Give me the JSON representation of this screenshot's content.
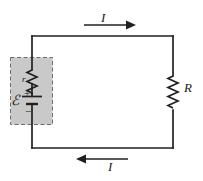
{
  "figure": {
    "background_color": "#ffffff",
    "wire_color": "#231f20",
    "battery_box_fill": "#c9c9c9",
    "battery_box_stroke": "#6e6e6e"
  },
  "labels": {
    "current_top": "I",
    "current_bottom": "I",
    "external_resistor": "R",
    "internal_resistance": "r",
    "emf": "ℰ",
    "battery_positive": "+",
    "battery_negative": "−"
  },
  "components": {
    "source_box": {
      "name": "real-battery-dashed-box",
      "x": 10,
      "y": 57,
      "width": 42,
      "height": 67,
      "style": "dashed"
    },
    "internal_resistor": {
      "name": "internal-resistance-r",
      "zigzags": 6
    },
    "battery_cell": {
      "name": "battery-cell",
      "polarity_top": "+",
      "polarity_bottom": "−"
    },
    "external_resistor": {
      "name": "external-resistor-R",
      "zigzags": 6
    },
    "loop": {
      "left": 32,
      "top": 36,
      "right": 173,
      "bottom": 148
    },
    "arrow_top": {
      "direction": "right",
      "x1": 84,
      "x2": 132,
      "y": 25
    },
    "arrow_bottom": {
      "direction": "left",
      "x1": 128,
      "x2": 80,
      "y": 159
    }
  }
}
